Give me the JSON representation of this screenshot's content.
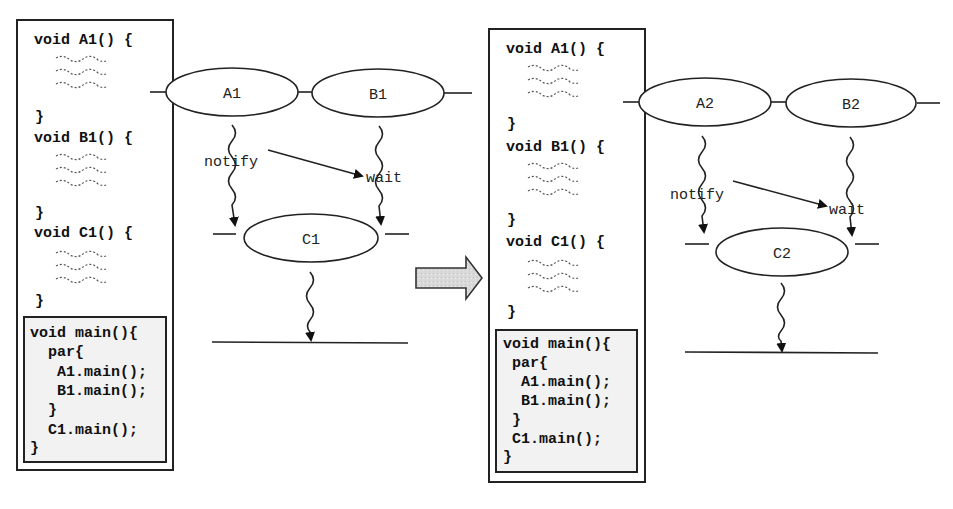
{
  "panels": [
    {
      "code": {
        "functions": [
          {
            "header": "void A1() {",
            "close": "}"
          },
          {
            "header": "void B1() {",
            "close": "}"
          },
          {
            "header": "void C1() {",
            "close": "}"
          }
        ],
        "main": {
          "lines": [
            "void main(){",
            "  par{",
            "   A1.main();",
            "   B1.main();",
            "  }",
            "  C1.main();",
            "}"
          ]
        }
      },
      "diagram": {
        "nodes": [
          {
            "id": "A1",
            "label": "A1"
          },
          {
            "id": "B1",
            "label": "B1"
          },
          {
            "id": "C1",
            "label": "C1"
          }
        ],
        "edge_labels": {
          "notify": "notify",
          "wait": "wait"
        }
      }
    },
    {
      "code": {
        "functions": [
          {
            "header": "void A1() {",
            "close": "}"
          },
          {
            "header": "void B1() {",
            "close": "}"
          },
          {
            "header": "void C1() {",
            "close": "}"
          }
        ],
        "main": {
          "lines": [
            "void main(){",
            " par{",
            "  A1.main();",
            "  B1.main();",
            " }",
            " C1.main();",
            "}"
          ]
        }
      },
      "diagram": {
        "nodes": [
          {
            "id": "A2",
            "label": "A2"
          },
          {
            "id": "B2",
            "label": "B2"
          },
          {
            "id": "C2",
            "label": "C2"
          }
        ],
        "edge_labels": {
          "notify": "notify",
          "wait": "wait"
        }
      }
    }
  ],
  "transition_arrow": {
    "fill": "#d8d8d8",
    "stroke": "#333333"
  }
}
